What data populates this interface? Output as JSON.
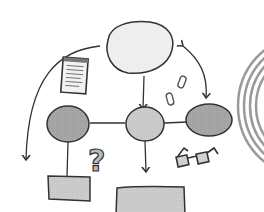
{
  "diagram": {
    "type": "hand-drawn mind map sketch",
    "colors": {
      "stroke": "#333333",
      "root_fill": "#eeeeee",
      "node_fill": "#a9a9a9",
      "leaf_fill": "#cccccc",
      "arc_gray": "#999999"
    },
    "nodes": [
      {
        "id": "root",
        "shape": "ellipse",
        "fill": "light"
      },
      {
        "id": "left",
        "shape": "ellipse",
        "fill": "dark"
      },
      {
        "id": "center",
        "shape": "ellipse",
        "fill": "medium"
      },
      {
        "id": "right",
        "shape": "ellipse",
        "fill": "dark"
      },
      {
        "id": "left-leaf",
        "shape": "rectangle",
        "fill": "light-gray"
      },
      {
        "id": "center-leaf",
        "shape": "rectangle",
        "fill": "light-gray"
      }
    ],
    "icons": [
      "notepad-icon",
      "paperclip-icon",
      "question-mark-icon",
      "glasses-icon",
      "spiral-icon"
    ],
    "question_mark": "?"
  }
}
